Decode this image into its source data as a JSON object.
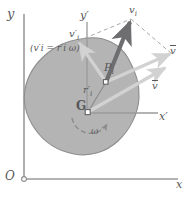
{
  "figure": {
    "type": "mechanics-vector-diagram",
    "canvas": {
      "width": 191,
      "height": 197
    }
  },
  "colors": {
    "background": "#ffffff",
    "body_fill": "#b4b4b4",
    "body_stroke": "#8d8d8d",
    "axis": "#9a9a9a",
    "dark_vector": "#6e6e70",
    "light_vector": "#d2d2d2",
    "dashed": "#a9a9a9",
    "label": "#58585a"
  },
  "axes": {
    "global": {
      "y_label": "y",
      "x_label": "x",
      "origin_label": "O"
    },
    "local": {
      "y_label": "y′",
      "x_label": "x′"
    }
  },
  "points": {
    "mass_center_label": "G",
    "particle_label_base": "P",
    "particle_label_sub": "i"
  },
  "vectors": {
    "absolute_velocity": {
      "base": "v",
      "sub": "i",
      "prime": false,
      "bar": false
    },
    "relative_velocity": {
      "base": "v",
      "sub": "i",
      "prime": true,
      "bar": false
    },
    "mass_center_velocity_right": {
      "base": "v",
      "bar": true
    },
    "mass_center_velocity_inner": {
      "base": "v",
      "bar": true
    }
  },
  "annotations": {
    "relative_speed_equation": "(v′i = r′i ω)",
    "position_vector": {
      "base": "r",
      "sub": "i",
      "prime": true
    },
    "angular_velocity": "ω"
  }
}
